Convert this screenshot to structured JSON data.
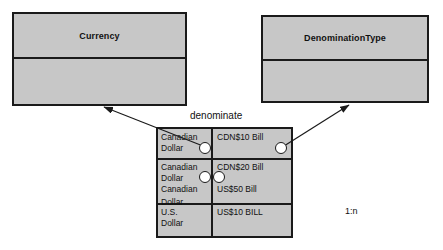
{
  "diagram": {
    "type": "uml-class-instance-diagram",
    "background_color": "#ffffff",
    "box_fill_color": "#c7c7c7",
    "line_color": "#1a1a1a",
    "dot_fill_color": "#ffffff"
  },
  "classes": [
    {
      "name": "Currency",
      "title": "Currency",
      "attributes": []
    },
    {
      "name": "DenominationType",
      "title": "DenominationType",
      "attributes": []
    }
  ],
  "association": {
    "label": "denominate",
    "cardinality": "1:n"
  },
  "instance_table": {
    "rows": [
      {
        "left_lines": [
          "Canadian",
          "Dollar"
        ],
        "right_lines": [
          "CDN$10 Bill"
        ]
      },
      {
        "left_lines": [
          "Canadian",
          "Dollar"
        ],
        "right_lines": [
          "CDN$20 Bill"
        ]
      },
      {
        "left_lines": [
          "Canadian",
          "Dollar"
        ],
        "right_lines": [
          "US$50 Bill"
        ]
      },
      {
        "left_lines": [
          "U.S.",
          "Dollar"
        ],
        "right_lines": [
          "US$10 BILL"
        ]
      }
    ],
    "cells": {
      "r1c1_line1": "Canadian",
      "r1c1_line2": "Dollar",
      "r1c2": "CDN$10 Bill",
      "r2c1_line1": "Canadian",
      "r2c1_line2": "Dollar",
      "r2c2": "CDN$20 Bill",
      "r3c1_line1": "Canadian",
      "r3c1_line2": "Dollar",
      "r3c2": "US$50 Bill",
      "r4c1_line1": "U.S.",
      "r4c1_line2": "Dollar",
      "r4c2": "US$10 BILL"
    }
  }
}
